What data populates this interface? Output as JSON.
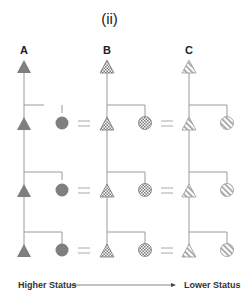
{
  "title": "(ii)",
  "columns": [
    {
      "label": "A",
      "fill": "solid",
      "color": "#808080"
    },
    {
      "label": "B",
      "fill": "checker",
      "color": "#808080"
    },
    {
      "label": "C",
      "fill": "stripes",
      "color": "#9a9a9a"
    }
  ],
  "rows": 3,
  "separator_symbol": "=",
  "legend": {
    "left": "Higher Status",
    "right": "Lower Status"
  },
  "colors": {
    "line": "#9a9a9a",
    "shape_dark": "#7f7f7f",
    "text": "#222222"
  }
}
